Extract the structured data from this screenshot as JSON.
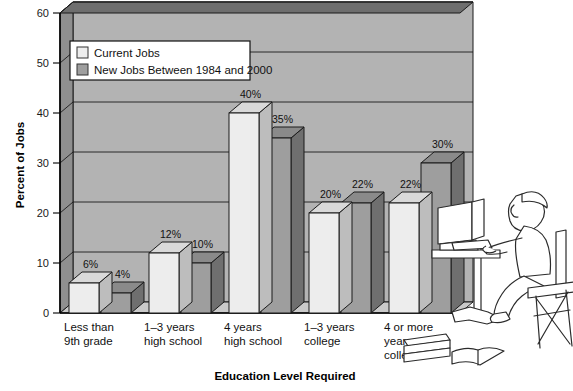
{
  "chart_data": {
    "type": "bar",
    "title": "",
    "xlabel": "Education Level Required",
    "ylabel": "Percent of Jobs",
    "categories": [
      "Less than 9th grade",
      "1–3 years high school",
      "4 years high school",
      "1–3 years college",
      "4 or more years college"
    ],
    "category_lines": [
      [
        "Less than",
        "9th grade"
      ],
      [
        "1–3 years",
        "high school"
      ],
      [
        "4 years",
        "high school"
      ],
      [
        "1–3 years",
        "college"
      ],
      [
        "4 or more",
        "years",
        "college"
      ]
    ],
    "series": [
      {
        "name": "Current Jobs",
        "values": [
          6,
          12,
          40,
          20,
          22
        ],
        "value_labels": [
          "6%",
          "12%",
          "40%",
          "20%",
          "22%"
        ],
        "color": "#ededed"
      },
      {
        "name": "New Jobs Between 1984 and 2000",
        "values": [
          4,
          10,
          35,
          22,
          30
        ],
        "value_labels": [
          "4%",
          "10%",
          "35%",
          "22%",
          "30%"
        ],
        "color": "#9e9e9e"
      }
    ],
    "ylim": [
      0,
      60
    ],
    "yticks": [
      0,
      10,
      20,
      30,
      40,
      50,
      60
    ],
    "ytick_labels": [
      "0",
      "10",
      "20",
      "30",
      "40",
      "50",
      "60"
    ],
    "grid": true,
    "legend_position": "top-left",
    "style": "3d-bar",
    "colors": {
      "plot_background": "#b3b3b3",
      "plot_side_wall": "#8f8f8f",
      "plot_top_wall": "#6e6e6e",
      "floor": "#c9c9c9",
      "series1_face": "#ededed",
      "series1_side": "#bdbdbd",
      "series1_top": "#d9d9d9",
      "series2_face": "#9e9e9e",
      "series2_side": "#6f6f6f",
      "series2_top": "#8a8a8a",
      "legend_background": "#ffffff",
      "axis_line": "#000000",
      "page_background": "#ffffff"
    }
  },
  "legend": {
    "items": [
      {
        "label": "Current Jobs",
        "swatch": "#ededed"
      },
      {
        "label": "New Jobs Between 1984 and 2000",
        "swatch": "#9e9e9e"
      }
    ]
  },
  "illustration": {
    "name": "person-at-computer-illustration",
    "parts": [
      "monitor",
      "keyboard",
      "desk",
      "chair",
      "person",
      "books",
      "open-book"
    ]
  }
}
